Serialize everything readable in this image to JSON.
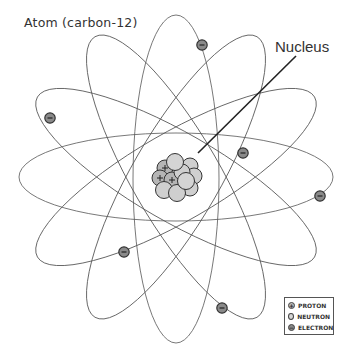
{
  "diagram": {
    "title": "Atom (carbon-12)",
    "callout_label": "Nucleus",
    "colors": {
      "orbit": "#555555",
      "electron_fill": "#8a8a8a",
      "electron_stroke": "#333333",
      "particle_fill": "#cfcfcf",
      "proton_fill": "#b5b5b5",
      "particle_stroke": "#333333",
      "leader_line": "#222222"
    },
    "orbits": [
      {
        "angle": 0
      },
      {
        "angle": 30
      },
      {
        "angle": 60
      },
      {
        "angle": 90
      },
      {
        "angle": 120
      },
      {
        "angle": 150
      }
    ],
    "electrons": [
      {
        "x": 202,
        "y": 45
      },
      {
        "x": 50,
        "y": 118
      },
      {
        "x": 243,
        "y": 153
      },
      {
        "x": 320,
        "y": 196
      },
      {
        "x": 124,
        "y": 252
      },
      {
        "x": 222,
        "y": 308
      }
    ],
    "electron_symbol": "−",
    "proton_symbol": "+",
    "legend": {
      "items": [
        {
          "key": "proton",
          "label": "PROTON",
          "symbol": "+"
        },
        {
          "key": "neutron",
          "label": "NEUTRON",
          "symbol": ""
        },
        {
          "key": "electron",
          "label": "ELECTRON",
          "symbol": "−"
        }
      ]
    }
  }
}
